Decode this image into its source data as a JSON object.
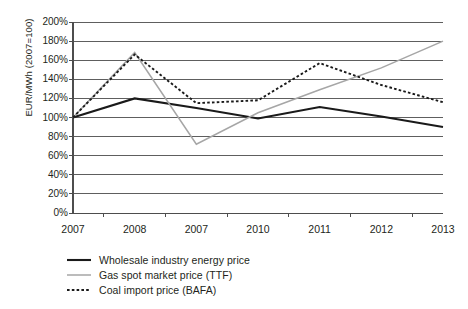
{
  "chart_data": {
    "type": "line",
    "title": "",
    "xlabel": "",
    "ylabel": "EUR/MWh (2007=100)",
    "categories": [
      "2007",
      "2008",
      "2007",
      "2010",
      "2011",
      "2012",
      "2013"
    ],
    "x_tick_labels": [
      "2007",
      "2008",
      "2007",
      "2010",
      "2011",
      "2012",
      "2013"
    ],
    "y_tick_labels": [
      "0%",
      "20%",
      "40%",
      "60%",
      "80%",
      "100%",
      "120%",
      "140%",
      "160%",
      "180%",
      "200%"
    ],
    "y_tick_values": [
      0,
      20,
      40,
      60,
      80,
      100,
      120,
      140,
      160,
      180,
      200
    ],
    "ylim": [
      0,
      200
    ],
    "grid": true,
    "grid_axis": "y",
    "legend_position": "below",
    "series": [
      {
        "name": "Wholesale industry energy price",
        "values": [
          100,
          120,
          110,
          99,
          111,
          101,
          90
        ],
        "color": "#1a1a1a",
        "style": "solid",
        "width": 2.1
      },
      {
        "name": "Gas spot market price (TTF)",
        "values": [
          100,
          168,
          72,
          105,
          129,
          152,
          180
        ],
        "color": "#a6a6a6",
        "style": "solid",
        "width": 1.5
      },
      {
        "name": "Coal import price (BAFA)",
        "values": [
          100,
          166,
          115,
          118,
          157,
          134,
          116
        ],
        "color": "#1a1a1a",
        "style": "dotted",
        "width": 1.9
      }
    ]
  },
  "legend": {
    "items": [
      {
        "label": "Wholesale industry energy price"
      },
      {
        "label": "Gas spot market price (TTF)"
      },
      {
        "label": "Coal import price (BAFA)"
      }
    ]
  }
}
